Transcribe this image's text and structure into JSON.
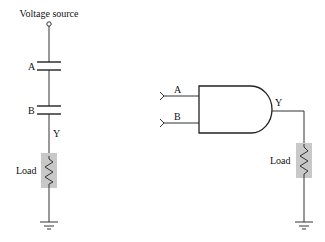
{
  "diagram": {
    "type": "circuit-comparison",
    "left_circuit": {
      "source_label": "Voltage source",
      "switch_a_label": "A",
      "switch_b_label": "B",
      "output_label": "Y",
      "load_label": "Load"
    },
    "right_circuit": {
      "gate": "AND",
      "input_a_label": "A",
      "input_b_label": "B",
      "output_label": "Y",
      "load_label": "Load"
    },
    "colors": {
      "wire": "#333333",
      "load_fill": "#c8c8c8",
      "background": "#ffffff"
    }
  }
}
